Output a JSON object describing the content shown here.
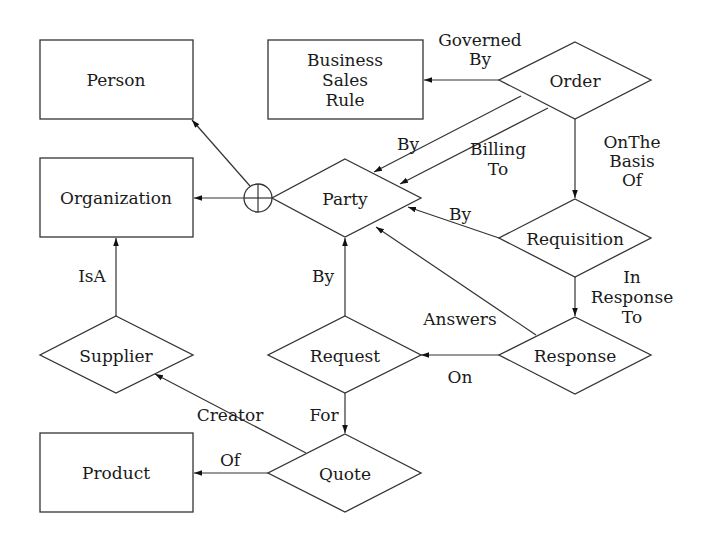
{
  "diagram": {
    "type": "entity-relationship",
    "entities": [
      {
        "id": "person",
        "label": "Person",
        "shape": "rectangle"
      },
      {
        "id": "organization",
        "label": "Organization",
        "shape": "rectangle"
      },
      {
        "id": "business_sales_rule",
        "label_lines": [
          "Business",
          "Sales",
          "Rule"
        ],
        "shape": "rectangle"
      },
      {
        "id": "product",
        "label": "Product",
        "shape": "rectangle"
      }
    ],
    "relationships": [
      {
        "id": "order",
        "label": "Order",
        "shape": "diamond"
      },
      {
        "id": "party",
        "label": "Party",
        "shape": "diamond"
      },
      {
        "id": "requisition",
        "label": "Requisition",
        "shape": "diamond"
      },
      {
        "id": "response",
        "label": "Response",
        "shape": "diamond"
      },
      {
        "id": "request",
        "label": "Request",
        "shape": "diamond"
      },
      {
        "id": "supplier",
        "label": "Supplier",
        "shape": "diamond"
      },
      {
        "id": "quote",
        "label": "Quote",
        "shape": "diamond"
      }
    ],
    "union_symbol": {
      "id": "party_union",
      "glyph": "circle-plus",
      "targets": [
        "person",
        "organization"
      ]
    },
    "edges": [
      {
        "from": "order",
        "to": "business_sales_rule",
        "label_lines": [
          "Governed",
          "By"
        ]
      },
      {
        "from": "order",
        "to": "party",
        "label_lines": [
          "By"
        ]
      },
      {
        "from": "order",
        "to": "party",
        "label_lines": [
          "Billing",
          "To"
        ]
      },
      {
        "from": "order",
        "to": "requisition",
        "label_lines": [
          "OnThe",
          "Basis",
          "Of"
        ]
      },
      {
        "from": "requisition",
        "to": "party",
        "label_lines": [
          "By"
        ]
      },
      {
        "from": "requisition",
        "to": "response",
        "label_lines": [
          "In",
          "Response",
          "To"
        ]
      },
      {
        "from": "response",
        "to": "party",
        "label_lines": [
          "Answers"
        ]
      },
      {
        "from": "response",
        "to": "request",
        "label_lines": [
          "On"
        ]
      },
      {
        "from": "request",
        "to": "party",
        "label_lines": [
          "By"
        ]
      },
      {
        "from": "request",
        "to": "quote",
        "label_lines": [
          "For"
        ]
      },
      {
        "from": "quote",
        "to": "supplier",
        "label_lines": [
          "Creator"
        ]
      },
      {
        "from": "quote",
        "to": "product",
        "label_lines": [
          "Of"
        ]
      },
      {
        "from": "supplier",
        "to": "organization",
        "label_lines": [
          "IsA"
        ]
      },
      {
        "from": "party_union",
        "to": "person",
        "label_lines": []
      },
      {
        "from": "party_union",
        "to": "organization",
        "label_lines": []
      }
    ]
  }
}
